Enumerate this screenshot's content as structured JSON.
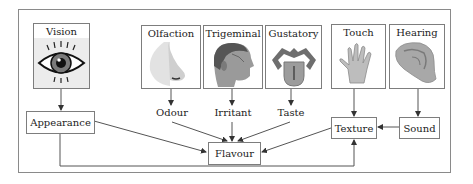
{
  "diagram": {
    "senses": [
      {
        "id": "vision",
        "label": "Vision",
        "icon": "eye-icon"
      },
      {
        "id": "olfaction",
        "label": "Olfaction",
        "icon": "nose-icon"
      },
      {
        "id": "trigeminal",
        "label": "Trigeminal",
        "icon": "head-icon"
      },
      {
        "id": "gustatory",
        "label": "Gustatory",
        "icon": "tongue-icon"
      },
      {
        "id": "touch",
        "label": "Touch",
        "icon": "hand-icon"
      },
      {
        "id": "hearing",
        "label": "Hearing",
        "icon": "ear-icon"
      }
    ],
    "intermediate_labels": {
      "odour": "Odour",
      "irritant": "Irritant",
      "taste": "Taste"
    },
    "nodes": {
      "appearance": "Appearance",
      "flavour": "Flavour",
      "texture": "Texture",
      "sound": "Sound"
    },
    "edges": [
      {
        "from": "Vision",
        "to": "Appearance"
      },
      {
        "from": "Olfaction",
        "to": "Odour"
      },
      {
        "from": "Trigeminal",
        "to": "Irritant"
      },
      {
        "from": "Gustatory",
        "to": "Taste"
      },
      {
        "from": "Touch",
        "to": "Texture"
      },
      {
        "from": "Hearing",
        "to": "Sound"
      },
      {
        "from": "Appearance",
        "to": "Flavour"
      },
      {
        "from": "Odour",
        "to": "Flavour"
      },
      {
        "from": "Irritant",
        "to": "Flavour"
      },
      {
        "from": "Taste",
        "to": "Flavour"
      },
      {
        "from": "Texture",
        "to": "Flavour"
      },
      {
        "from": "Sound",
        "to": "Texture"
      },
      {
        "from": "Appearance",
        "to": "Texture"
      }
    ]
  }
}
